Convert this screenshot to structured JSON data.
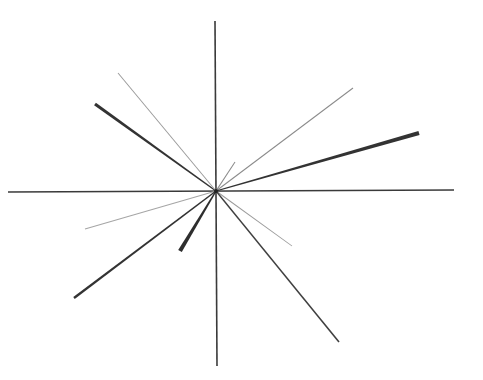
{
  "diagram": {
    "type": "radial-line-star",
    "canvas": {
      "width": 483,
      "height": 380,
      "background": "#ffffff"
    },
    "center": {
      "x": 216,
      "y": 191
    },
    "axes": [
      {
        "name": "vertical-axis",
        "x1": 215,
        "y1": 21,
        "x2": 217,
        "y2": 366,
        "width": 1.6,
        "color": "#3a3a3a"
      },
      {
        "name": "horizontal-axis",
        "x1": 8,
        "y1": 192,
        "x2": 454,
        "y2": 190,
        "width": 1.6,
        "color": "#3a3a3a"
      }
    ],
    "rays": [
      {
        "name": "ray-upper-left-thick",
        "x": 95,
        "y": 104,
        "width_end": 3.2,
        "width_center": 1.2,
        "color": "#333333"
      },
      {
        "name": "ray-upper-left-thin",
        "x": 118,
        "y": 73,
        "width_end": 1.0,
        "width_center": 1.0,
        "color": "#9a9a9a"
      },
      {
        "name": "ray-upper-right-thin",
        "x": 353,
        "y": 88,
        "width_end": 1.0,
        "width_center": 1.0,
        "color": "#8a8a8a"
      },
      {
        "name": "ray-right-thick",
        "x": 419,
        "y": 133,
        "width_end": 4.2,
        "width_center": 1.2,
        "color": "#333333"
      },
      {
        "name": "ray-upper-right-stub",
        "x": 235,
        "y": 162,
        "width_end": 1.0,
        "width_center": 1.2,
        "color": "#8a8a8a"
      },
      {
        "name": "ray-lower-left-thin",
        "x": 85,
        "y": 229,
        "width_end": 0.9,
        "width_center": 1.0,
        "color": "#a5a5a5"
      },
      {
        "name": "ray-lower-left-thick",
        "x": 74,
        "y": 298,
        "width_end": 2.4,
        "width_center": 1.4,
        "color": "#333333"
      },
      {
        "name": "ray-lower-left-wedge",
        "x": 180,
        "y": 251,
        "width_end": 4.2,
        "width_center": 1.4,
        "color": "#2e2e2e"
      },
      {
        "name": "ray-lower-right-short",
        "x": 292,
        "y": 246,
        "width_end": 0.9,
        "width_center": 1.1,
        "color": "#9a9a9a"
      },
      {
        "name": "ray-lower-right-long",
        "x": 339,
        "y": 342,
        "width_end": 1.6,
        "width_center": 1.4,
        "color": "#404040"
      }
    ]
  }
}
